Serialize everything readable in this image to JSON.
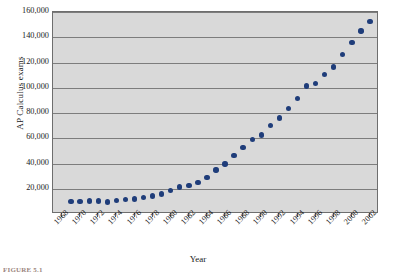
{
  "figure": {
    "caption": "FIGURE 5.1"
  },
  "chart_data": {
    "type": "scatter",
    "title": "",
    "xlabel": "Year",
    "ylabel": "AP Calculus exams",
    "xlim": [
      1967,
      2003
    ],
    "ylim": [
      0,
      160000
    ],
    "grid": true,
    "legend": false,
    "marker_color": "#1f3d7a",
    "plot_background": "#d9d9d9",
    "gridline_color": "#7d7d7d",
    "ytick_labels": [
      "20,000",
      "40,000",
      "60,000",
      "80,000",
      "100,000",
      "120,000",
      "140,000",
      "160,000"
    ],
    "ytick_values": [
      20000,
      40000,
      60000,
      80000,
      100000,
      120000,
      140000,
      160000
    ],
    "xtick_labels": [
      "1968",
      "1970",
      "1972",
      "1974",
      "1976",
      "1978",
      "1980",
      "1982",
      "1984",
      "1986",
      "1988",
      "1990",
      "1992",
      "1994",
      "1996",
      "1998",
      "2000",
      "2002"
    ],
    "xtick_values": [
      1968,
      1970,
      1972,
      1974,
      1976,
      1978,
      1980,
      1982,
      1984,
      1986,
      1988,
      1990,
      1992,
      1994,
      1996,
      1998,
      2000,
      2002
    ],
    "x": [
      1969,
      1970,
      1971,
      1972,
      1973,
      1974,
      1975,
      1976,
      1977,
      1978,
      1979,
      1980,
      1981,
      1982,
      1983,
      1984,
      1985,
      1986,
      1987,
      1988,
      1989,
      1990,
      1991,
      1992,
      1993,
      1994,
      1995,
      1996,
      1997,
      1998,
      1999,
      2000,
      2001,
      2002
    ],
    "values": [
      10000,
      10000,
      10200,
      10200,
      9500,
      10800,
      11300,
      12000,
      13000,
      14200,
      16000,
      18500,
      21300,
      22500,
      25000,
      28800,
      34800,
      39500,
      46200,
      52500,
      59200,
      62500,
      70200,
      76000,
      83500,
      91500,
      101500,
      103500,
      110500,
      116300,
      126300,
      136000,
      145000,
      152500
    ]
  }
}
